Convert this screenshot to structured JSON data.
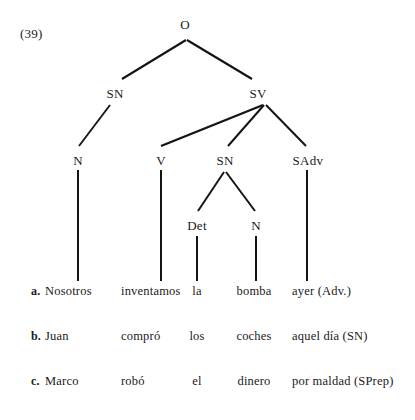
{
  "example": {
    "number": "(39)"
  },
  "tree": {
    "nodes": [
      {
        "id": "root",
        "label": "O",
        "x": 185,
        "y": 18
      },
      {
        "id": "sn1",
        "label": "SN",
        "x": 115,
        "y": 87
      },
      {
        "id": "sv",
        "label": "SV",
        "x": 258,
        "y": 87
      },
      {
        "id": "n1",
        "label": "N",
        "x": 78,
        "y": 154
      },
      {
        "id": "v",
        "label": "V",
        "x": 161,
        "y": 154
      },
      {
        "id": "sn2",
        "label": "SN",
        "x": 225,
        "y": 154
      },
      {
        "id": "sadv",
        "label": "SAdv",
        "x": 308,
        "y": 154
      },
      {
        "id": "det",
        "label": "Det",
        "x": 197,
        "y": 219
      },
      {
        "id": "n2",
        "label": "N",
        "x": 256,
        "y": 219
      }
    ],
    "edges": [
      {
        "from": "root",
        "to": "sn1",
        "x1": 186,
        "y1": 40,
        "x2": 122,
        "y2": 79,
        "width": 2.1
      },
      {
        "from": "root",
        "to": "sv",
        "x1": 187,
        "y1": 40,
        "x2": 252,
        "y2": 79,
        "width": 2.1
      },
      {
        "from": "sn1",
        "to": "n1",
        "x1": 110,
        "y1": 105,
        "x2": 79,
        "y2": 146,
        "width": 1.9
      },
      {
        "from": "sv",
        "to": "v",
        "x1": 263,
        "y1": 105,
        "x2": 161,
        "y2": 146,
        "width": 2.4
      },
      {
        "from": "sv",
        "to": "sn2",
        "x1": 264,
        "y1": 105,
        "x2": 228,
        "y2": 146,
        "width": 2.0
      },
      {
        "from": "sv",
        "to": "sadv",
        "x1": 266,
        "y1": 105,
        "x2": 306,
        "y2": 146,
        "width": 2.0
      },
      {
        "from": "sn2",
        "to": "det",
        "x1": 224,
        "y1": 172,
        "x2": 198,
        "y2": 211,
        "width": 2.0
      },
      {
        "from": "sn2",
        "to": "n2",
        "x1": 226,
        "y1": 172,
        "x2": 255,
        "y2": 211,
        "width": 2.0
      }
    ],
    "stems": [
      {
        "node": "n1",
        "x": 78,
        "y1": 170,
        "y2": 281,
        "width": 2.0
      },
      {
        "node": "v",
        "x": 161,
        "y1": 170,
        "y2": 281,
        "width": 2.0
      },
      {
        "node": "sadv",
        "x": 307,
        "y1": 170,
        "y2": 281,
        "width": 2.0
      },
      {
        "node": "det",
        "x": 197,
        "y1": 236,
        "y2": 281,
        "width": 2.0
      },
      {
        "node": "n2",
        "x": 256,
        "y1": 236,
        "y2": 281,
        "width": 2.0
      }
    ]
  },
  "sentences": {
    "columns": [
      "letter",
      "subject",
      "verb",
      "determiner",
      "noun",
      "adjunct"
    ],
    "rows": [
      {
        "letter": "a.",
        "subject": "Nosotros",
        "verb": "inventamos",
        "determiner": "la",
        "noun": "bomba",
        "adjunct": "ayer  (Adv.)"
      },
      {
        "letter": "b.",
        "subject": "Juan",
        "verb": "compró",
        "determiner": "los",
        "noun": "coches",
        "adjunct": "aquel día  (SN)"
      },
      {
        "letter": "c.",
        "subject": "Marco",
        "verb": "robó",
        "determiner": "el",
        "noun": "dinero",
        "adjunct": "por maldad  (SPrep)"
      }
    ]
  },
  "colors": {
    "ink": "#1a1a1a",
    "line": "#141414",
    "background": "#ffffff"
  }
}
